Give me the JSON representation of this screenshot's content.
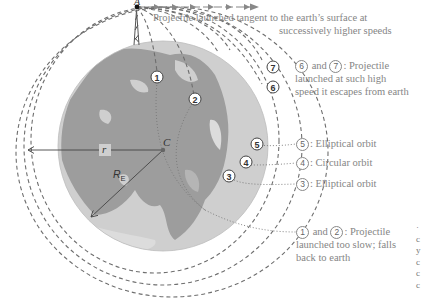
{
  "figure": {
    "title_line1": "Projectile launched tangent to the earth’s surface at",
    "title_line2": "successively higher speeds",
    "point_labels": {
      "launch_point": "A",
      "center": "C",
      "orbit_radius": "r",
      "earth_radius": "R",
      "earth_radius_sub": "E"
    },
    "trajectory_markers": [
      "1",
      "2",
      "3",
      "4",
      "5",
      "6",
      "7"
    ],
    "annotations": [
      {
        "ids": [
          "6",
          "7"
        ],
        "joiner": "and",
        "line1": ": Projectile",
        "line2": "launched at such high",
        "line3": "speed it escapes from earth"
      },
      {
        "ids": [
          "5"
        ],
        "text": ": Elliptical orbit"
      },
      {
        "ids": [
          "4"
        ],
        "text": ": Circular orbit"
      },
      {
        "ids": [
          "3"
        ],
        "text": ": Elliptical orbit"
      },
      {
        "ids": [
          "1",
          "2"
        ],
        "joiner": "and",
        "line1": ": Projectile",
        "line2": "launched too slow; falls",
        "line3": "back to earth"
      }
    ],
    "clipped_right_text": [
      "·",
      "c",
      "y",
      "c",
      "c",
      "c"
    ],
    "colors": {
      "earth_ocean": "#cfcfcf",
      "earth_land": "#9d9d9d",
      "orbit_dash": "#6e6e6e",
      "text": "#858585",
      "tower": "#555555"
    }
  }
}
